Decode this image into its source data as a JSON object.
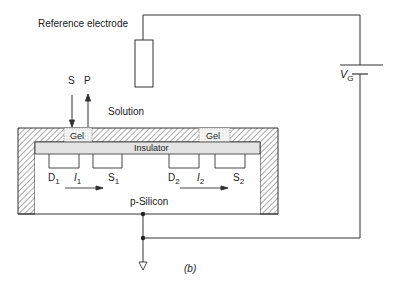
{
  "labels": {
    "reference_electrode": "Reference electrode",
    "solution": "Solution",
    "substrate_in": "S",
    "product_out": "P",
    "gel_left": "Gel",
    "gel_right": "Gel",
    "insulator": "Insulator",
    "silicon": "p-Silicon",
    "drain1": "D",
    "drain1_sub": "1",
    "current1": "I",
    "current1_sub": "1",
    "source1": "S",
    "source1_sub": "1",
    "drain2": "D",
    "drain2_sub": "2",
    "current2": "I",
    "current2_sub": "2",
    "source2": "S",
    "source2_sub": "2",
    "gate_voltage": "V",
    "gate_voltage_sub": "G",
    "figure_tag": "(b)"
  },
  "colors": {
    "line": "#333333",
    "insulator_fill": "#e4e4e4",
    "gel_fill": "#f4f4f4",
    "hatch": "#555555"
  }
}
